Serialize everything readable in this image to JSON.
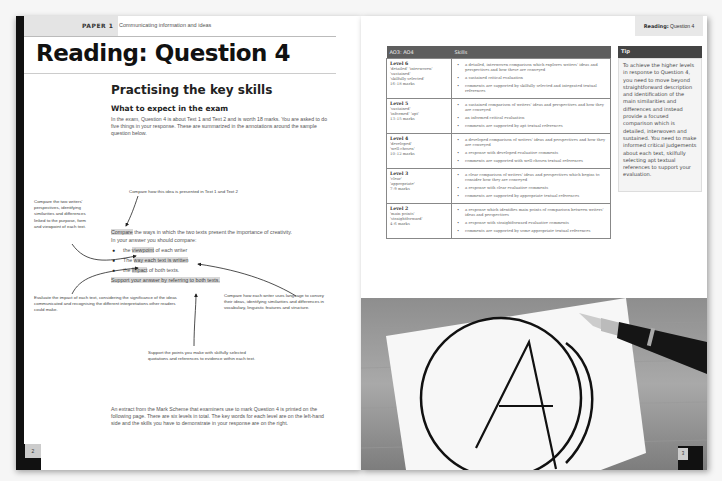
{
  "left_page": {
    "header": {
      "paper_label": "PAPER 1",
      "paper_subtitle": "Communicating information and ideas"
    },
    "title": "Reading: Question 4",
    "section_title": "Practising the key skills",
    "sub_title": "What to expect in the exam",
    "intro": "In the exam, Question 4 is about Text 1 and Text 2 and is worth 18 marks. You are asked to do five things in your response. These are summarized in the annotations around the sample question below.",
    "annotations": {
      "top": "Compare how this idea is presented in Text 1 and Text 2",
      "left": "Compare the two writers' perspectives, identifying similarities and differences linked to the purpose, form and viewpoint of each text.",
      "bottom_left": "Evaluate the impact of each text, considering the significance of the ideas communicated and recognising the different interpretations other readers could make.",
      "bottom_right": "Compare how each writer uses language to convey their ideas, identifying similarities and differences in vocabulary, linguistic features and structure.",
      "bottom_center": "Support the points you make with skilfully selected quotations and references to evidence within each text."
    },
    "question": {
      "line1_highlight": "Compare",
      "line1_rest": " the ways in which the two texts present the importance of creativity.",
      "line2": "In your answer you should compare:",
      "bullets": [
        {
          "pre": "the ",
          "highlight": "viewpoint",
          "post": " of each writer"
        },
        {
          "pre": "The ",
          "highlight": "way each text is written",
          "post": ""
        },
        {
          "pre": "the ",
          "highlight": "impact",
          "post": " of both texts."
        }
      ],
      "support": "Support your answer by referring to both texts."
    },
    "outro": "An extract from the Mark Scheme that examiners use to mark Question 4 is printed on the following page. There are six levels in total. The key words for each level are on the left-hand side and the skills you have to demonstrate in your response are on the right.",
    "page_number": "2"
  },
  "right_page": {
    "header": {
      "bold": "Reading:",
      "rest": " Question 4"
    },
    "table": {
      "headers": [
        "AO3: AO4",
        "Skills"
      ],
      "rows": [
        {
          "level": "Level 6",
          "keywords": [
            "'detailed' 'interwoven'",
            "'sustained'",
            "'skilfully selected'"
          ],
          "marks": "16–18 marks",
          "skills": [
            "a detailed, interwoven comparison which explores writers' ideas and perspectives and how these are conveyed",
            "a sustained critical evaluation",
            "comments are supported by skilfully selected and integrated textual references"
          ]
        },
        {
          "level": "Level 5",
          "keywords": [
            "'sustained'",
            "'informed' 'apt'"
          ],
          "marks": "13–15 marks",
          "skills": [
            "a sustained comparison of writers' ideas and perspectives and how they are conveyed",
            "an informed critical evaluation",
            "comments are supported by apt textual references"
          ]
        },
        {
          "level": "Level 4",
          "keywords": [
            "'developed'",
            "'well-chosen'"
          ],
          "marks": "10–12 marks",
          "skills": [
            "a developed comparison of writers' ideas and perspectives and how they are conveyed",
            "a response with developed evaluative comments",
            "comments are supported with well-chosen textual references"
          ]
        },
        {
          "level": "Level 3",
          "keywords": [
            "'clear'",
            "'appropriate'"
          ],
          "marks": "7–9 marks",
          "skills": [
            "a clear comparison of writers' ideas and perspectives which begins to consider how they are conveyed",
            "a response with clear evaluative comments",
            "comments are supported by appropriate textual references"
          ]
        },
        {
          "level": "Level 2",
          "keywords": [
            "'main points'",
            "'straightforward'"
          ],
          "marks": "4–6 marks",
          "skills": [
            "a response which identifies main points of comparison between writers' ideas and perspectives",
            "a response with straightforward evaluative comments",
            "comments are supported by some appropriate textual references"
          ]
        }
      ]
    },
    "tip": {
      "title": "Tip",
      "body": "To achieve the higher levels in response to Question 4, you need to move beyond straightforward description and identification of the main similarities and differences and instead provide a focused comparison which is detailed, interwoven and sustained. You need to make informed critical judgements about each text, skilfully selecting apt textual references to support your evaluation."
    },
    "photo": {
      "description": "A circled letter A drawn on white paper with a fountain pen on a wooden desk",
      "letter": "A"
    },
    "page_number": "3"
  }
}
